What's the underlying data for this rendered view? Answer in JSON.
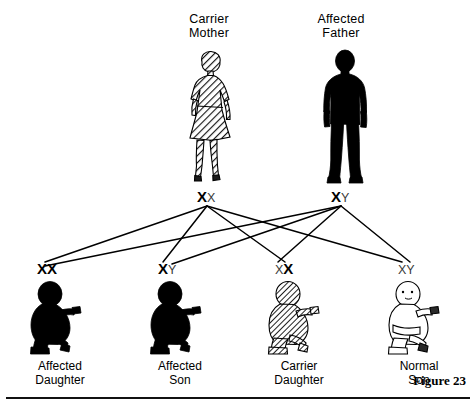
{
  "figure": {
    "number_label": "Figure 23"
  },
  "parents": [
    {
      "id": "mother",
      "caption": "Carrier\nMother",
      "status": "carrier",
      "fill_style": "hatched",
      "genotype": {
        "text": "XX",
        "alleles": [
          {
            "letter": "X",
            "emphasis": "strong"
          },
          {
            "letter": "X",
            "emphasis": "weak"
          }
        ]
      }
    },
    {
      "id": "father",
      "caption": "Affected\nFather",
      "status": "affected",
      "fill_style": "solid-black",
      "genotype": {
        "text": "XY",
        "alleles": [
          {
            "letter": "X",
            "emphasis": "strong"
          },
          {
            "letter": "Y",
            "emphasis": "weak"
          }
        ]
      }
    }
  ],
  "children": [
    {
      "id": "affected-daughter",
      "caption": "Affected\nDaughter",
      "status": "affected",
      "fill_style": "solid-black",
      "genotype": {
        "text": "XX",
        "alleles": [
          {
            "letter": "X",
            "emphasis": "strong"
          },
          {
            "letter": "X",
            "emphasis": "strong"
          }
        ]
      }
    },
    {
      "id": "affected-son",
      "caption": "Affected\nSon",
      "status": "affected",
      "fill_style": "solid-black",
      "genotype": {
        "text": "XY",
        "alleles": [
          {
            "letter": "X",
            "emphasis": "strong"
          },
          {
            "letter": "Y",
            "emphasis": "weak"
          }
        ]
      }
    },
    {
      "id": "carrier-daughter",
      "caption": "Carrier\nDaughter",
      "status": "carrier",
      "fill_style": "hatched",
      "genotype": {
        "text": "XX",
        "alleles": [
          {
            "letter": "X",
            "emphasis": "weak"
          },
          {
            "letter": "X",
            "emphasis": "strong"
          }
        ]
      }
    },
    {
      "id": "normal-son",
      "caption": "Normal\nSon",
      "status": "normal",
      "fill_style": "outline",
      "genotype": {
        "text": "XY",
        "alleles": [
          {
            "letter": "X",
            "emphasis": "weak"
          },
          {
            "letter": "Y",
            "emphasis": "weak"
          }
        ]
      }
    }
  ],
  "colors": {
    "ink": "#000000",
    "paper": "#ffffff",
    "hatch": "#1a1a1a",
    "weak_allele": "#3a3a3a"
  },
  "legend_note": ""
}
